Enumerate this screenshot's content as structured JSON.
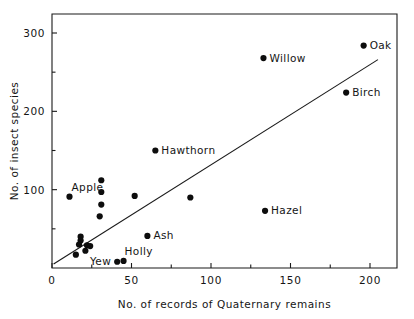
{
  "chart_data": {
    "type": "scatter",
    "title": "",
    "xlabel": "No. of records of Quaternary remains",
    "ylabel": "No. of insect species",
    "xlim": [
      0,
      215
    ],
    "ylim": [
      0,
      320
    ],
    "grid": false,
    "legend": "none",
    "x_ticks_major": [
      0,
      50,
      100,
      150,
      200
    ],
    "x_ticks_minor": [
      25,
      75,
      125,
      175
    ],
    "y_ticks_major": [
      100,
      200,
      300
    ],
    "y_ticks_minor": [
      50,
      150,
      250
    ],
    "x_tick_labels": [
      "0",
      "50",
      "100",
      "150",
      "200"
    ],
    "y_tick_labels": [
      "100",
      "200",
      "300"
    ],
    "points": [
      {
        "label": "Oak",
        "x": 196,
        "y": 284,
        "label_pos": "right"
      },
      {
        "label": "Willow",
        "x": 133,
        "y": 268,
        "label_pos": "right"
      },
      {
        "label": "Birch",
        "x": 185,
        "y": 224,
        "label_pos": "right"
      },
      {
        "label": "Hawthorn",
        "x": 65,
        "y": 150,
        "label_pos": "right"
      },
      {
        "label": "Hazel",
        "x": 134,
        "y": 73,
        "label_pos": "right"
      },
      {
        "label": "Apple",
        "x": 11,
        "y": 91,
        "label_pos": "above"
      },
      {
        "label": "Ash",
        "x": 60,
        "y": 41,
        "label_pos": "right"
      },
      {
        "label": "Yew",
        "x": 41,
        "y": 8,
        "label_pos": "left"
      },
      {
        "label": "Holly",
        "x": 45,
        "y": 9,
        "label_pos": "above-right"
      },
      {
        "label": "",
        "x": 31,
        "y": 112
      },
      {
        "label": "",
        "x": 31,
        "y": 97
      },
      {
        "label": "",
        "x": 31,
        "y": 81
      },
      {
        "label": "",
        "x": 30,
        "y": 66
      },
      {
        "label": "",
        "x": 52,
        "y": 92
      },
      {
        "label": "",
        "x": 87,
        "y": 90
      },
      {
        "label": "",
        "x": 18,
        "y": 40
      },
      {
        "label": "",
        "x": 18,
        "y": 35
      },
      {
        "label": "",
        "x": 17,
        "y": 30
      },
      {
        "label": "",
        "x": 22,
        "y": 29
      },
      {
        "label": "",
        "x": 24,
        "y": 28
      },
      {
        "label": "",
        "x": 21,
        "y": 22
      },
      {
        "label": "",
        "x": 15,
        "y": 17
      }
    ],
    "fit_line": {
      "x1": 1,
      "y1": 5,
      "x2": 205,
      "y2": 266
    }
  }
}
